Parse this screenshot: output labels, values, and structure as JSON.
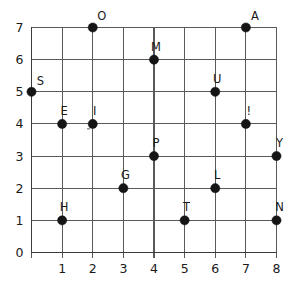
{
  "chart_data": {
    "type": "scatter",
    "title": "",
    "xlabel": "",
    "ylabel": "",
    "xlim": [
      0,
      8
    ],
    "ylim": [
      0,
      7
    ],
    "grid": true,
    "legend": "none",
    "x_ticks": [
      "1",
      "2",
      "3",
      "4",
      "5",
      "6",
      "7",
      "8"
    ],
    "x_tick_values": [
      1,
      2,
      3,
      4,
      5,
      6,
      7,
      8
    ],
    "y_ticks": [
      "0",
      "1",
      "2",
      "3",
      "4",
      "5",
      "6",
      "7"
    ],
    "y_tick_values": [
      0,
      1,
      2,
      3,
      4,
      5,
      6,
      7
    ],
    "origin_label": "0",
    "point_color": "#151515",
    "grid_color": "#58595b",
    "axis_color": "#3b3b3d",
    "points": [
      {
        "label": "S",
        "x": 0,
        "y": 5,
        "label_dx": 9,
        "label_dy": -7
      },
      {
        "label": "O",
        "x": 2,
        "y": 7,
        "label_dx": 9,
        "label_dy": -8
      },
      {
        "label": "A",
        "x": 7,
        "y": 7,
        "label_dx": 9,
        "label_dy": -8
      },
      {
        "label": "M",
        "x": 4,
        "y": 6,
        "label_dx": 2,
        "label_dy": -9
      },
      {
        "label": "U",
        "x": 6,
        "y": 5,
        "label_dx": 2,
        "label_dy": -9
      },
      {
        "label": "E",
        "x": 1,
        "y": 4,
        "label_dx": 2,
        "label_dy": -9
      },
      {
        "label": "I",
        "x": 2,
        "y": 4,
        "label_dx": 2,
        "label_dy": -9
      },
      {
        "label": "!",
        "x": 7,
        "y": 4,
        "label_dx": 3,
        "label_dy": -9
      },
      {
        "label": "P",
        "x": 4,
        "y": 3,
        "label_dx": 2,
        "label_dy": -9
      },
      {
        "label": "Y",
        "x": 8,
        "y": 3,
        "label_dx": 3,
        "label_dy": -9
      },
      {
        "label": "G",
        "x": 3,
        "y": 2,
        "label_dx": 2,
        "label_dy": -9
      },
      {
        "label": "L",
        "x": 6,
        "y": 2,
        "label_dx": 2,
        "label_dy": -9
      },
      {
        "label": "H",
        "x": 1,
        "y": 1,
        "label_dx": 2,
        "label_dy": -9
      },
      {
        "label": "T",
        "x": 5,
        "y": 1,
        "label_dx": 2,
        "label_dy": -9
      },
      {
        "label": "N",
        "x": 8,
        "y": 1,
        "label_dx": 3,
        "label_dy": -9
      }
    ]
  }
}
